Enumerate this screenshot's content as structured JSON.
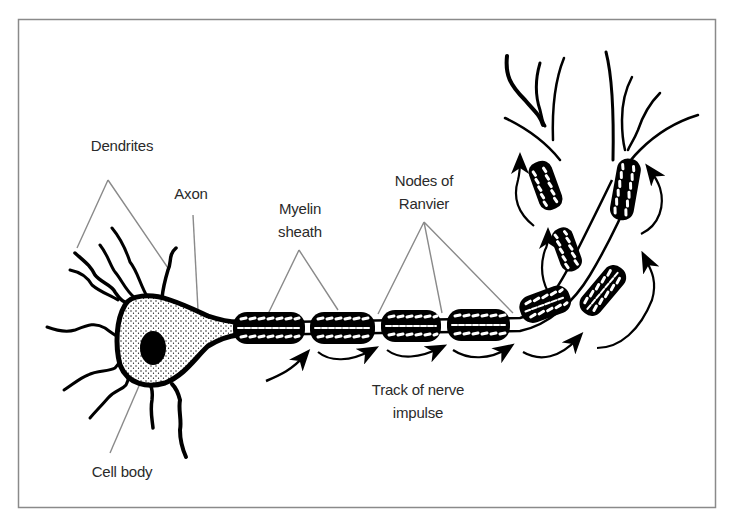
{
  "diagram": {
    "type": "anatomical-diagram",
    "frame_color": "#8a8a8a",
    "leader_line_color": "#8a8a8a",
    "ink_color": "#000000"
  },
  "labels": {
    "dendrites": "Dendrites",
    "axon": "Axon",
    "myelin_line1": "Myelin",
    "myelin_line2": "sheath",
    "nodes_line1": "Nodes of",
    "nodes_line2": "Ranvier",
    "track_line1": "Track of nerve",
    "track_line2": "impulse",
    "cell_body": "Cell body"
  },
  "parts": [
    {
      "name": "Dendrites",
      "pointer_count": 2
    },
    {
      "name": "Axon",
      "pointer_count": 1
    },
    {
      "name": "Myelin sheath",
      "pointer_count": 2
    },
    {
      "name": "Nodes of Ranvier",
      "pointer_count": 3
    },
    {
      "name": "Track of nerve impulse",
      "pointer_count": 0
    },
    {
      "name": "Cell body",
      "pointer_count": 1
    }
  ]
}
